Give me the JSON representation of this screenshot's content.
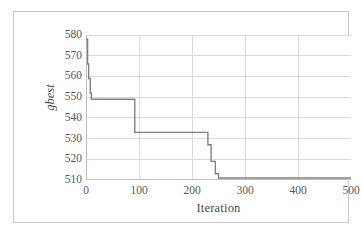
{
  "chart_data": {
    "type": "line",
    "title": "",
    "xlabel": "Iteration",
    "ylabel": "gbest",
    "xlim": [
      0,
      500
    ],
    "ylim": [
      510,
      580
    ],
    "xticks": [
      "0",
      "100",
      "200",
      "300",
      "400",
      "500"
    ],
    "xtick_values": [
      0,
      100,
      200,
      300,
      400,
      500
    ],
    "yticks": [
      "510",
      "520",
      "530",
      "540",
      "550",
      "560",
      "570",
      "580"
    ],
    "ytick_values": [
      510,
      520,
      530,
      540,
      550,
      560,
      570,
      580
    ],
    "grid": "horizontal-and-vertical",
    "legend": "none",
    "series": [
      {
        "name": "gbest",
        "color": "#808080",
        "line_width": 1.4,
        "step": "post",
        "x": [
          0,
          2,
          3,
          5,
          6,
          8,
          10,
          90,
          92,
          228,
          230,
          234,
          236,
          242,
          244,
          248,
          250,
          500
        ],
        "y": [
          578,
          578,
          566,
          559,
          559,
          552,
          549,
          549,
          533,
          533,
          527,
          527,
          519,
          519,
          513,
          513,
          511,
          511
        ]
      }
    ]
  },
  "figure": {
    "background_color": "#ffffff",
    "frame_color": "#c9c9c9",
    "gridline_color": "#d9d9d9",
    "axis_color": "#bfbfbf",
    "tick_label_color": "#595959"
  }
}
